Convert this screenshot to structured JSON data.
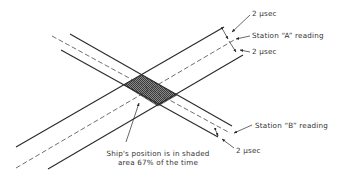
{
  "diagram": {
    "type": "hyperbolic-navigation-fix-accuracy",
    "labels": {
      "a_top_width": "2 μsec",
      "a_reading": "Station “A” reading",
      "a_bottom_width": "2 μsec",
      "b_reading": "Station “B” reading",
      "b_width": "2 μsec",
      "caption_line1": "Ship's position is in shaded",
      "caption_line2": "area 67% of the time"
    },
    "colors": {
      "line": "#2a2a2a",
      "shade": "#6a6a6a",
      "text": "#333333",
      "background": "#ffffff"
    },
    "bands": [
      {
        "name": "Station A",
        "direction": "ascending",
        "band_width": "2 μsec each side"
      },
      {
        "name": "Station B",
        "direction": "descending",
        "band_width": "2 μsec"
      }
    ],
    "shaded_region": {
      "probability": "67%"
    }
  }
}
